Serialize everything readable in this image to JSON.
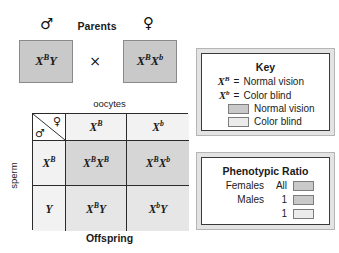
{
  "parents": {
    "title": "Parents",
    "male_symbol": "♂",
    "female_symbol": "♀",
    "cross_symbol": "×",
    "male_genotype": {
      "base1": "X",
      "sup1": "B",
      "base2": "Y"
    },
    "female_genotype": {
      "base1": "X",
      "sup1": "B",
      "base2": "X",
      "sup2": "b"
    }
  },
  "punnett": {
    "top_label": "oocytes",
    "side_label": "sperm",
    "bottom_label": "Offspring",
    "corner_female_symbol": "♀",
    "corner_male_symbol": "♂",
    "col_headers": [
      {
        "base": "X",
        "sup": "B"
      },
      {
        "base": "X",
        "sup": "b"
      }
    ],
    "row_headers": [
      {
        "base": "X",
        "sup": "B"
      },
      {
        "base": "Y",
        "sup": ""
      }
    ],
    "cells": [
      [
        {
          "base1": "X",
          "sup1": "B",
          "base2": "X",
          "sup2": "B"
        },
        {
          "base1": "X",
          "sup1": "B",
          "base2": "X",
          "sup2": "b"
        }
      ],
      [
        {
          "base1": "X",
          "sup1": "B",
          "base2": "Y",
          "sup2": ""
        },
        {
          "base1": "X",
          "sup1": "b",
          "base2": "Y",
          "sup2": ""
        }
      ]
    ]
  },
  "key_panel": {
    "title": "Key",
    "allele_lines": [
      {
        "base": "X",
        "sup": "B",
        "eq": "=",
        "text": "Normal vision"
      },
      {
        "base": "X",
        "sup": "b",
        "eq": "=",
        "text": "Color blind"
      }
    ],
    "swatch_lines": [
      {
        "text": "Normal vision",
        "swatch": "normal"
      },
      {
        "text": "Color blind",
        "swatch": "colorblind"
      }
    ]
  },
  "ratio_panel": {
    "title": "Phenotypic Ratio",
    "rows": [
      {
        "sex": "Females",
        "count": "All",
        "swatch": "normal"
      },
      {
        "sex": "Males",
        "count": "1",
        "swatch": "normal"
      },
      {
        "sex": "",
        "count": "1",
        "swatch": "colorblind"
      }
    ]
  },
  "colors": {
    "shaded_cell": "#d6d6d6",
    "light_cell": "#f2f2f2",
    "parent_box": "#c9c9c9",
    "panel_frame": "#e3e3e3",
    "border_dark": "#2b2b2b"
  }
}
